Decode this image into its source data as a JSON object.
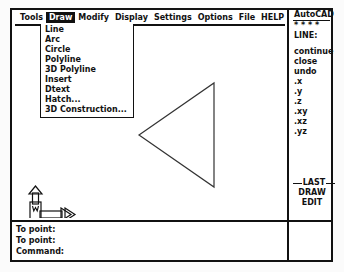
{
  "app": {
    "title": "AutoCAD"
  },
  "menubar": {
    "items": [
      {
        "label": "Tools",
        "active": false
      },
      {
        "label": "Draw",
        "active": true
      },
      {
        "label": "Modify",
        "active": false
      },
      {
        "label": "Display",
        "active": false
      },
      {
        "label": "Settings",
        "active": false
      },
      {
        "label": "Options",
        "active": false
      },
      {
        "label": "File",
        "active": false
      },
      {
        "label": "HELP",
        "active": false
      }
    ]
  },
  "pulldown": {
    "owner": "Draw",
    "items": [
      {
        "label": "Line"
      },
      {
        "label": "Arc"
      },
      {
        "label": "Circle"
      },
      {
        "label": "Polyline"
      },
      {
        "label": "3D Polyline"
      },
      {
        "label": "Insert"
      },
      {
        "label": "Dtext"
      },
      {
        "label": "Hatch..."
      },
      {
        "label": "3D Construction..."
      }
    ]
  },
  "sidepanel": {
    "header": "AutoCAD",
    "stars": "* * * *",
    "active_command": "LINE:",
    "options": [
      {
        "label": "continue"
      },
      {
        "label": "close"
      },
      {
        "label": "undo"
      },
      {
        "label": ".x"
      },
      {
        "label": ".y"
      },
      {
        "label": ".z"
      },
      {
        "label": ".xy"
      },
      {
        "label": ".xz"
      },
      {
        "label": ".yz"
      }
    ],
    "bottom": {
      "last": "LAST",
      "draw": "DRAW",
      "edit": "EDIT"
    }
  },
  "ucs": {
    "origin_label": "W",
    "x_axis_label": "X",
    "y_axis_label": "Y"
  },
  "command_area": {
    "lines": [
      {
        "text": "To point:"
      },
      {
        "text": "To point:"
      },
      {
        "text": "Command:"
      }
    ]
  },
  "drawing": {
    "shape": "triangle",
    "vertices": [
      {
        "x": 200,
        "y": 57
      },
      {
        "x": 200,
        "y": 161
      },
      {
        "x": 125,
        "y": 109
      }
    ],
    "stroke_color": "#333333"
  },
  "colors": {
    "ink": "#111111",
    "paper": "#ffffff",
    "desktop": "#fbfbfb",
    "highlight_bg": "#111111",
    "highlight_fg": "#ffffff"
  }
}
